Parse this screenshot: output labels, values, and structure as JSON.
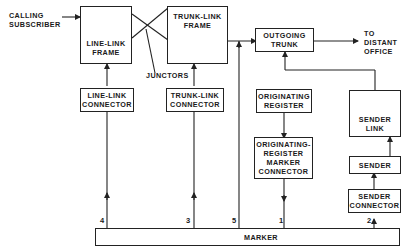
{
  "diagram": {
    "inputs": {
      "calling_subscriber": [
        "CALLING",
        "SUBSCRIBER"
      ],
      "distant_office": [
        "TO",
        "DISTANT",
        "OFFICE"
      ]
    },
    "boxes": {
      "line_link_frame": [
        "LINE-LINK",
        "FRAME"
      ],
      "trunk_link_frame": [
        "TRUNK-LINK",
        "FRAME"
      ],
      "outgoing_trunk": [
        "OUTGOING",
        "TRUNK"
      ],
      "line_link_connector": [
        "LINE-LINK",
        "CONNECTOR"
      ],
      "trunk_link_connector": [
        "TRUNK-LINK",
        "CONNECTOR"
      ],
      "originating_register": [
        "ORIGINATING",
        "REGISTER"
      ],
      "originating_register_marker_connector": [
        "ORIGINATING-",
        "REGISTER",
        "MARKER",
        "CONNECTOR"
      ],
      "sender_link": [
        "SENDER",
        "LINK"
      ],
      "sender": [
        "SENDER"
      ],
      "sender_connector": [
        "SENDER",
        "CONNECTOR"
      ],
      "marker": [
        "MARKER"
      ]
    },
    "annotations": {
      "junctors": "JUNCTORS"
    },
    "connection_numbers": {
      "n4": "4",
      "n3": "3",
      "n5": "5",
      "n1": "1",
      "n2": "2"
    }
  }
}
